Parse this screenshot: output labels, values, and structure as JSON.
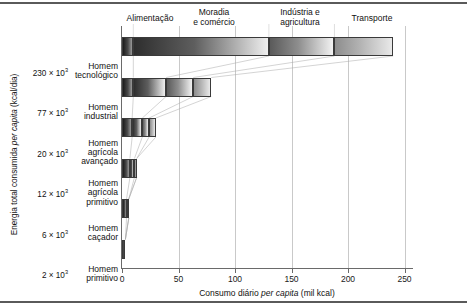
{
  "figure": {
    "x_axis_title_prefix": "Consumo diário ",
    "x_axis_title_italic": "per capita",
    "x_axis_title_suffix": " (mil kcal)",
    "y_axis_title_prefix": "Energia total consumida ",
    "y_axis_title_italic": "per capita",
    "y_axis_title_suffix": " (kcal/dia)"
  },
  "chart_data": {
    "type": "bar",
    "orientation": "horizontal",
    "stacked": true,
    "title": "",
    "xlabel": "Consumo diário per capita (mil kcal)",
    "ylabel": "Energia total consumida per capita (kcal/dia)",
    "xlim": [
      0,
      265
    ],
    "xticks": [
      0,
      50,
      100,
      150,
      200,
      250
    ],
    "xtick_labels": [
      "0",
      "50",
      "100",
      "150",
      "200",
      "250"
    ],
    "grid": true,
    "legend_position": "top",
    "categories": [
      "Homem tecnológico",
      "Homem industrial",
      "Homem agrícola avançado",
      "Homem agrícola primitivo",
      "Homem caçador",
      "Homem primitivo"
    ],
    "category_lines": [
      [
        "Homem",
        "tecnológico"
      ],
      [
        "Homem",
        "industrial"
      ],
      [
        "Homem",
        "agrícola",
        "avançado"
      ],
      [
        "Homem",
        "agrícola",
        "primitivo"
      ],
      [
        "Homem",
        "caçador"
      ],
      [
        "Homem",
        "primitivo"
      ]
    ],
    "y_value_labels": [
      {
        "mantissa": "230",
        "exponent": "3"
      },
      {
        "mantissa": "77",
        "exponent": "3"
      },
      {
        "mantissa": "20",
        "exponent": "3"
      },
      {
        "mantissa": "12",
        "exponent": "3"
      },
      {
        "mantissa": "6",
        "exponent": "3"
      },
      {
        "mantissa": "2",
        "exponent": "3"
      }
    ],
    "series": [
      {
        "name": "Alimentação",
        "values": [
          10,
          10,
          9,
          7,
          4,
          3
        ]
      },
      {
        "name": "Moradia e comércio",
        "values": [
          120,
          29,
          9,
          4,
          2,
          0
        ]
      },
      {
        "name": "Indústria e agricultura",
        "values": [
          58,
          24,
          6,
          2,
          0,
          0
        ]
      },
      {
        "name": "Transporte",
        "values": [
          52,
          16,
          6,
          0,
          0,
          0
        ]
      }
    ],
    "totals": [
      240,
      79,
      30,
      13,
      6,
      3
    ],
    "annotations": []
  },
  "group_headers": [
    {
      "lines": [
        "Alimentação"
      ]
    },
    {
      "lines": [
        "Moradia",
        "e comércio"
      ]
    },
    {
      "lines": [
        "Indústria e",
        "agricultura"
      ]
    },
    {
      "lines": [
        "Transporte"
      ]
    }
  ]
}
